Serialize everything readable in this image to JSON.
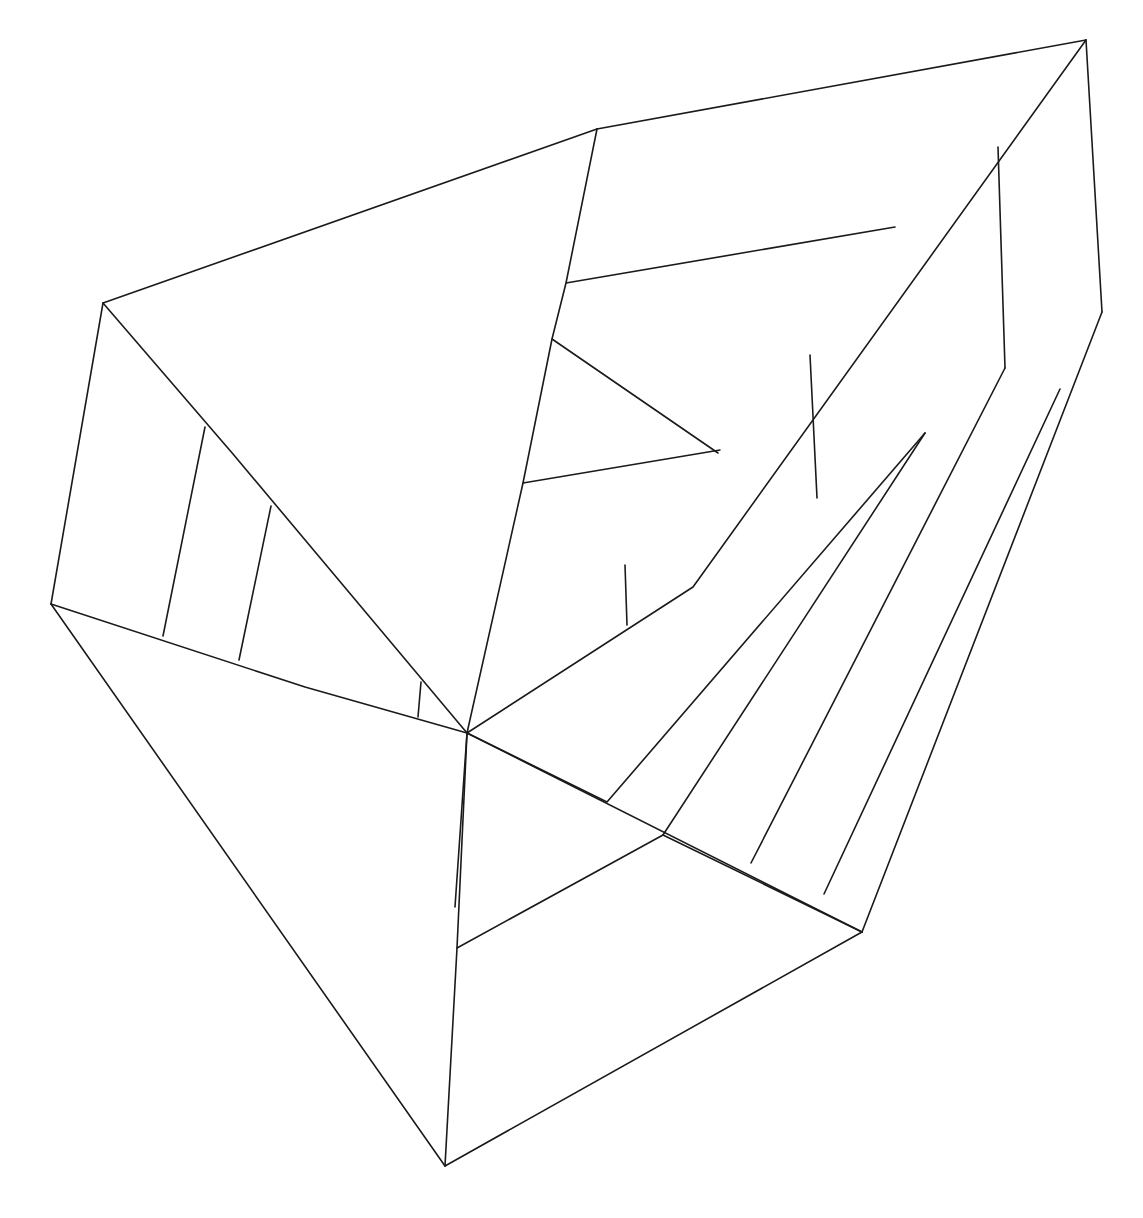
{
  "document": {
    "kind": "line-drawing",
    "title": "Faceted polygon wireframe",
    "background_color": "#ffffff",
    "stroke_color": "#1a1a1a",
    "stroke_width": 1.6,
    "width": 1143,
    "height": 1218
  },
  "chart_data": {
    "type": "line",
    "xlabel": "",
    "ylabel": "",
    "xlim": [
      0,
      1143
    ],
    "ylim": [
      0,
      1218
    ],
    "grid": false,
    "legend": "none",
    "vertices": {
      "top_left_peak": [
        103,
        303
      ],
      "top_bend": [
        597,
        129
      ],
      "top_right_apex": [
        1086,
        40
      ],
      "right_vertex": [
        1102,
        312
      ],
      "left_vertex": [
        51,
        604
      ],
      "bottom_apex": [
        445,
        1166
      ],
      "bottom_right_vertex": [
        862,
        932
      ],
      "hub": [
        467,
        733
      ]
    },
    "polylines": [
      {
        "name": "outline-top-left-edge",
        "points": [
          [
            103,
            303
          ],
          [
            597,
            129
          ]
        ]
      },
      {
        "name": "outline-top-right-edge",
        "points": [
          [
            597,
            129
          ],
          [
            1086,
            40
          ]
        ]
      },
      {
        "name": "outline-right-upper-edge",
        "points": [
          [
            1086,
            40
          ],
          [
            1102,
            312
          ]
        ]
      },
      {
        "name": "outline-right-lower-edge",
        "points": [
          [
            1102,
            312
          ],
          [
            862,
            932
          ]
        ]
      },
      {
        "name": "outline-bottom-right-edge",
        "points": [
          [
            862,
            932
          ],
          [
            445,
            1166
          ]
        ]
      },
      {
        "name": "outline-bottom-left-edge",
        "points": [
          [
            445,
            1166
          ],
          [
            51,
            604
          ]
        ]
      },
      {
        "name": "outline-left-edge",
        "points": [
          [
            51,
            604
          ],
          [
            103,
            303
          ]
        ]
      },
      {
        "name": "crease-topleft-to-hub",
        "points": [
          [
            103,
            303
          ],
          [
            233,
            454
          ],
          [
            467,
            733
          ]
        ]
      },
      {
        "name": "crease-bend-to-hub",
        "points": [
          [
            597,
            129
          ],
          [
            566,
            283
          ],
          [
            552,
            339
          ],
          [
            523,
            483
          ],
          [
            467,
            733
          ]
        ]
      },
      {
        "name": "crease-apex-to-hub",
        "points": [
          [
            1086,
            40
          ],
          [
            693,
            587
          ],
          [
            467,
            733
          ]
        ]
      },
      {
        "name": "crease-band-lower",
        "points": [
          [
            925,
            433
          ],
          [
            607,
            802
          ],
          [
            467,
            733
          ]
        ]
      },
      {
        "name": "crease-hub-to-right-lower",
        "points": [
          [
            467,
            733
          ],
          [
            862,
            932
          ]
        ]
      },
      {
        "name": "crease-hub-down",
        "points": [
          [
            467,
            733
          ],
          [
            457,
            948
          ],
          [
            445,
            1166
          ]
        ]
      },
      {
        "name": "crease-hub-down-left",
        "points": [
          [
            467,
            733
          ],
          [
            455,
            907
          ]
        ]
      },
      {
        "name": "crease-left-vertex-to-hub-chain",
        "points": [
          [
            51,
            604
          ],
          [
            305,
            687
          ],
          [
            467,
            733
          ]
        ]
      },
      {
        "name": "fold-left-band-a",
        "points": [
          [
            205,
            427
          ],
          [
            163,
            636
          ]
        ]
      },
      {
        "name": "fold-left-band-b",
        "points": [
          [
            271,
            506
          ],
          [
            239,
            660
          ]
        ]
      },
      {
        "name": "fold-small-left-of-hub",
        "points": [
          [
            421,
            682
          ],
          [
            418,
            717
          ]
        ]
      },
      {
        "name": "fold-upper-mid-horizontal",
        "points": [
          [
            566,
            283
          ],
          [
            895,
            227
          ]
        ]
      },
      {
        "name": "fold-mid-horizontal",
        "points": [
          [
            552,
            339
          ],
          [
            718,
            453
          ]
        ]
      },
      {
        "name": "fold-lower-mid-horizontal",
        "points": [
          [
            523,
            483
          ],
          [
            720,
            450
          ]
        ]
      },
      {
        "name": "fold-vertical-right-top",
        "points": [
          [
            998,
            147
          ],
          [
            1005,
            368
          ]
        ]
      },
      {
        "name": "fold-vertical-band-mid",
        "points": [
          [
            810,
            355
          ],
          [
            817,
            498
          ]
        ]
      },
      {
        "name": "fold-vertical-band-small",
        "points": [
          [
            625,
            565
          ],
          [
            627,
            625
          ]
        ]
      },
      {
        "name": "fold-right-panel-a",
        "points": [
          [
            925,
            433
          ],
          [
            663,
            835
          ]
        ]
      },
      {
        "name": "fold-right-panel-b",
        "points": [
          [
            1005,
            368
          ],
          [
            751,
            863
          ]
        ]
      },
      {
        "name": "fold-right-panel-c",
        "points": [
          [
            1060,
            389
          ],
          [
            824,
            894
          ]
        ]
      },
      {
        "name": "crease-lower-right-chain",
        "points": [
          [
            457,
            948
          ],
          [
            663,
            835
          ],
          [
            862,
            932
          ]
        ]
      }
    ]
  }
}
